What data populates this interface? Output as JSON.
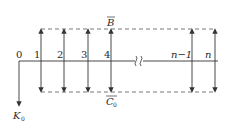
{
  "diagram": {
    "origin_label": "0",
    "output_label": "K",
    "output_sub": "0",
    "top_label": "B",
    "bottom_label": "C",
    "bottom_sub": "0",
    "nodes": [
      {
        "label": "1",
        "x": 41
      },
      {
        "label": "2",
        "x": 64
      },
      {
        "label": "3",
        "x": 88
      },
      {
        "label": "4",
        "x": 111
      },
      {
        "label": "n−1",
        "x": 192
      },
      {
        "label": "n",
        "x": 215
      }
    ],
    "break_symbol": "≀",
    "colors": {
      "line": "#333333",
      "dashed": "#555555",
      "background": "#ffffff"
    }
  }
}
